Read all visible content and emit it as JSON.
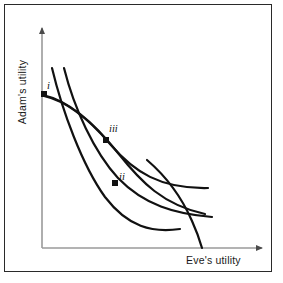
{
  "figure": {
    "border_color": "#2a2a2a",
    "background": "#ffffff"
  },
  "axes": {
    "x_label": "Eve's utility",
    "y_label": "Adam's utility",
    "axis_color": "#9a9a9a",
    "origin": {
      "x": 42,
      "y": 248
    },
    "x_end": {
      "x": 266,
      "y": 248
    },
    "y_end": {
      "x": 42,
      "y": 24
    },
    "arrowheads": true,
    "ticks": false,
    "gridlines": false
  },
  "points": [
    {
      "id": "i",
      "label": "i",
      "x": 45,
      "y": 95,
      "marker": "square",
      "label_x": 47,
      "label_y": 80
    },
    {
      "id": "ii",
      "label": "ii",
      "x": 115,
      "y": 183,
      "marker": "square",
      "label_x": 119,
      "label_y": 171
    },
    {
      "id": "iii",
      "label": "iii",
      "x": 106,
      "y": 140,
      "marker": "square",
      "label_x": 109,
      "label_y": 123
    }
  ],
  "curves": [
    {
      "name": "utility-possibility-frontier",
      "role": "frontier",
      "stroke": "#111111",
      "width": 2.2,
      "path": "M 43 95 C 70 101 95 124 118 153 C 141 182 163 205 205 214"
    },
    {
      "name": "indifference-curve-low",
      "role": "indifference",
      "stroke": "#111111",
      "width": 2.2,
      "path": "M 52 68 C 62 110 82 165 105 197 C 128 227 152 233 180 229"
    },
    {
      "name": "indifference-curve-mid",
      "role": "indifference",
      "stroke": "#111111",
      "width": 2.2,
      "path": "M 64 68 C 74 108 94 152 118 178 C 144 205 175 214 212 217"
    },
    {
      "name": "social-indifference-curve",
      "role": "social-welfare",
      "stroke": "#111111",
      "width": 2.2,
      "path": "M 44 96 C 66 101 88 118 110 144 C 134 172 160 189 208 188"
    },
    {
      "name": "steep-locus",
      "role": "locus",
      "stroke": "#111111",
      "width": 2.2,
      "path": "M 147 160 C 168 178 182 198 192 221 C 197 232 200 241 202 248"
    }
  ],
  "colors": {
    "curve": "#111111",
    "axis": "#9a9a9a",
    "text": "#1a1a1a",
    "frame": "#2a2a2a"
  }
}
